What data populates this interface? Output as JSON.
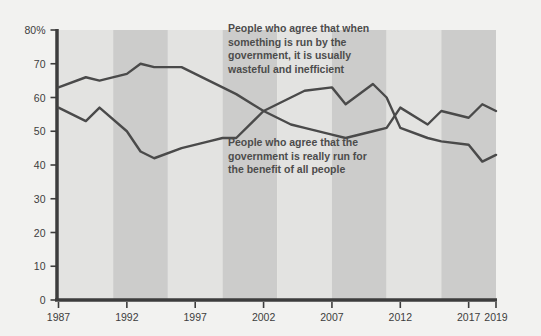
{
  "chart_data": {
    "type": "line",
    "title": "",
    "subtitle": "",
    "xlabel": "",
    "ylabel": "",
    "xlim": [
      1987,
      2019
    ],
    "ylim": [
      0,
      80
    ],
    "grid": false,
    "legend_position": "inline-annotations",
    "y_ticks": [
      "0",
      "10",
      "20",
      "30",
      "40",
      "50",
      "60",
      "70",
      "80%"
    ],
    "y_tick_values": [
      0,
      10,
      20,
      30,
      40,
      50,
      60,
      70,
      80
    ],
    "x_ticks": [
      "1987",
      "1992",
      "1997",
      "2002",
      "2007",
      "2012",
      "2017",
      "2019"
    ],
    "x_tick_values": [
      1987,
      1992,
      1997,
      2002,
      2007,
      2012,
      2017,
      2019
    ],
    "series": [
      {
        "name": "People who agree that when something is run by the government, it is usually wasteful and inefficient",
        "color": "#4a4a4a",
        "x": [
          1987,
          1989,
          1990,
          1992,
          1993,
          1994,
          1996,
          1998,
          1999,
          2000,
          2002,
          2003,
          2004,
          2005,
          2007,
          2008,
          2010,
          2011,
          2012,
          2014,
          2015,
          2017,
          2018,
          2019
        ],
        "values": [
          63,
          66,
          65,
          67,
          70,
          69,
          69,
          65,
          63,
          61,
          56,
          54,
          52,
          51,
          49,
          48,
          50,
          51,
          57,
          52,
          56,
          54,
          58,
          56
        ]
      },
      {
        "name": "People who agree that the government is really run for the benefit of all people",
        "color": "#4a4a4a",
        "x": [
          1987,
          1989,
          1990,
          1992,
          1993,
          1994,
          1996,
          1998,
          1999,
          2000,
          2002,
          2003,
          2004,
          2005,
          2007,
          2008,
          2010,
          2011,
          2012,
          2014,
          2015,
          2017,
          2018,
          2019
        ],
        "values": [
          57,
          53,
          57,
          50,
          44,
          42,
          45,
          47,
          48,
          48,
          56,
          58,
          60,
          62,
          63,
          58,
          64,
          60,
          51,
          48,
          47,
          46,
          41,
          43
        ]
      }
    ],
    "annotations": [
      {
        "name": "wasteful-annotation",
        "lines": [
          "People who agree that when",
          "something is run by the",
          "government, it is usually",
          "wasteful and inefficient"
        ],
        "x": 228,
        "y": 32
      },
      {
        "name": "benefit-annotation",
        "lines": [
          "People who agree that the",
          "government is really run for",
          "the benefit of all people"
        ],
        "x": 228,
        "y": 146
      }
    ],
    "background_bands": {
      "light": "#e3e3e1",
      "dark": "#cccccb",
      "count": 8
    },
    "page_background": "#f2f2f0",
    "axis_color": "#3d3d3d",
    "line_color": "#4a4a4a"
  }
}
